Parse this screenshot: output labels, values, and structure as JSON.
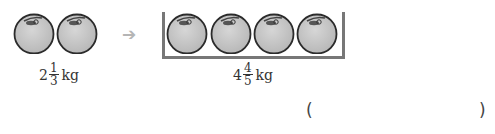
{
  "left_group": {
    "ball_count": 2,
    "weight": {
      "whole": "2",
      "numerator": "1",
      "denominator": "3",
      "unit": "kg"
    }
  },
  "arrow": {
    "icon": "right-arrow-icon",
    "glyph": "➔",
    "color": "#b5b5b5"
  },
  "right_group": {
    "ball_count": 4,
    "container": "box",
    "weight": {
      "whole": "4",
      "numerator": "4",
      "denominator": "5",
      "unit": "kg"
    }
  },
  "answer": {
    "open_paren": "(",
    "value": "",
    "close_paren": ")"
  },
  "colors": {
    "ball_fill": "#c9c9c9",
    "ball_stroke": "#2b2b2b",
    "box": "#777777"
  }
}
